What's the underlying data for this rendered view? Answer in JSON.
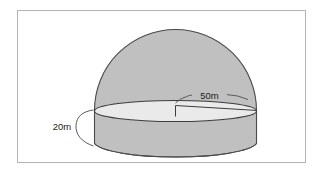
{
  "figure": {
    "shape_description": "A 3D solid drawn as a hemisphere (dome) resting on a short cylinder, with an elliptical top surface shown in perspective.",
    "frame": {
      "border_color": "#b4b4b4",
      "background": "#ffffff"
    },
    "colors": {
      "solid_fill": "#c0c0c0",
      "top_face_fill": "#eaeaea",
      "outline": "#4a4a4a",
      "leader_line": "#5a5a5a",
      "text": "#1a1a1a"
    },
    "labels": [
      {
        "id": "radius-label",
        "name": "radius",
        "text": "50m",
        "value": 50,
        "unit": "m",
        "refers_to": "radius of circular top face of cylinder / dome base"
      },
      {
        "id": "height-label",
        "name": "cylinder-height",
        "text": "20m",
        "value": 20,
        "unit": "m",
        "refers_to": "vertical height of the cylindrical base"
      }
    ],
    "parts": [
      {
        "name": "dome",
        "type": "hemisphere"
      },
      {
        "name": "cylinder-wall",
        "type": "cylinder-side"
      },
      {
        "name": "top-ellipse",
        "type": "ellipse-face"
      },
      {
        "name": "radius-line",
        "type": "dimension-line"
      },
      {
        "name": "radius-leader-arc",
        "type": "leader"
      },
      {
        "name": "height-brace",
        "type": "brace"
      }
    ]
  }
}
